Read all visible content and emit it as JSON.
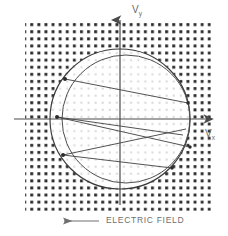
{
  "figure": {
    "axes": {
      "vertical_axis_label": "V",
      "vertical_axis_subscript": "y",
      "horizontal_axis_label": "V",
      "horizontal_axis_subscript": "x",
      "origin_x": 120,
      "origin_y": 119,
      "vertical_axis_top": 18,
      "vertical_axis_bottom": 205,
      "horizontal_axis_left": 14,
      "horizontal_axis_right": 214,
      "axis_color": "#4a4a4a"
    },
    "annotation": {
      "text": "ELECTRIC FIELD",
      "arrow_direction": "left",
      "arrow_x_start": 99,
      "arrow_x_end": 62,
      "arrow_y": 221,
      "color": "#6f6f6f"
    },
    "background_grid": {
      "description": "halftone dot matrix",
      "outer_dot_color": "#2e2e2e",
      "inner_dot_color": "#dedede",
      "x_start": 25,
      "y_start": 20,
      "x_end": 211,
      "y_end": 211,
      "spacing": 7.1,
      "outer_dot_size": 2.8,
      "inner_dot_size": 2.0
    },
    "circles": [
      {
        "name": "outer-circle",
        "cx": 120,
        "cy": 119,
        "r": 70,
        "color": "#3a3a3a",
        "width": 1.1
      },
      {
        "name": "inner-circle",
        "cx": 126,
        "cy": 119,
        "r": 64,
        "color": "#4a4a4a",
        "width": 1.0
      }
    ],
    "chords": [
      {
        "name": "chord-1",
        "x1": 65,
        "y1": 79,
        "x2": 188,
        "y2": 103
      },
      {
        "name": "chord-2",
        "x1": 57,
        "y1": 117,
        "x2": 190,
        "y2": 147
      },
      {
        "name": "chord-3",
        "x1": 57,
        "y1": 117,
        "x2": 183,
        "y2": 135
      },
      {
        "name": "chord-4",
        "x1": 63,
        "y1": 155,
        "x2": 186,
        "y2": 129
      },
      {
        "name": "chord-5",
        "x1": 63,
        "y1": 155,
        "x2": 172,
        "y2": 168
      }
    ],
    "markers": [
      {
        "name": "marker-upper-left",
        "cx": 65,
        "cy": 79
      },
      {
        "name": "marker-mid-left",
        "cx": 57,
        "cy": 117
      },
      {
        "name": "marker-lower-left",
        "cx": 63,
        "cy": 155
      },
      {
        "name": "marker-right-upper",
        "cx": 188,
        "cy": 103
      },
      {
        "name": "marker-right-mid",
        "cx": 190,
        "cy": 147
      },
      {
        "name": "marker-right-lower",
        "cx": 172,
        "cy": 168
      }
    ]
  }
}
